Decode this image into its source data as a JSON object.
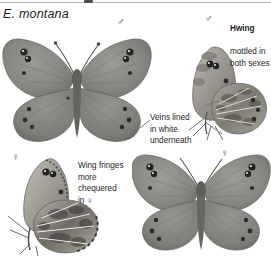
{
  "plate": {
    "width": 271,
    "height": 256,
    "background": "#ffffff",
    "rule_color": "#b9b9b9"
  },
  "title": "E. montana",
  "symbols": [
    {
      "name": "male-symbol-upper-left",
      "glyph": "♂",
      "x": 117,
      "y": 17
    },
    {
      "name": "male-symbol-upper-right",
      "glyph": "♂",
      "x": 205,
      "y": 14
    },
    {
      "name": "female-symbol-lower-left",
      "glyph": "♀",
      "x": 12,
      "y": 152
    },
    {
      "name": "female-symbol-lower-right",
      "glyph": "♀",
      "x": 221,
      "y": 148
    }
  ],
  "callouts": [
    {
      "name": "hwing-callout",
      "heading": "Hwing",
      "body": "mottled in\nboth sexes",
      "x": 230,
      "y": 12,
      "width": 42
    },
    {
      "name": "veins-callout",
      "heading": "",
      "body": "Veins lined\nin white\nunderneath",
      "x": 150,
      "y": 101,
      "width": 56
    },
    {
      "name": "wing-fringes-callout",
      "heading": "",
      "body": "Wing fringes\nmore\nchequered\nin ♀",
      "x": 78,
      "y": 149,
      "width": 60
    }
  ],
  "specimens": [
    {
      "name": "male-dorsal-large",
      "sex": "♂",
      "view": "upperside",
      "x": 2,
      "y": 26,
      "width": 150,
      "height": 116
    },
    {
      "name": "male-ventral",
      "sex": "♂",
      "view": "underside",
      "x": 185,
      "y": 26,
      "width": 86,
      "height": 116
    },
    {
      "name": "female-ventral",
      "sex": "♀",
      "view": "underside",
      "x": 8,
      "y": 152,
      "width": 96,
      "height": 104
    },
    {
      "name": "female-dorsal-large",
      "sex": "♀",
      "view": "upperside",
      "x": 132,
      "y": 152,
      "width": 139,
      "height": 104
    }
  ],
  "colors": {
    "wing_upper": "#8a8a86",
    "wing_upper_dark": "#6f6f6c",
    "wing_under_light": "#b9b5ac",
    "wing_mottle": "#5d5a54",
    "eyespot": "#2b2b2b",
    "eyespot_ring": "#d9b98d",
    "body": "#6a6761",
    "text": "#1d1d1d"
  }
}
